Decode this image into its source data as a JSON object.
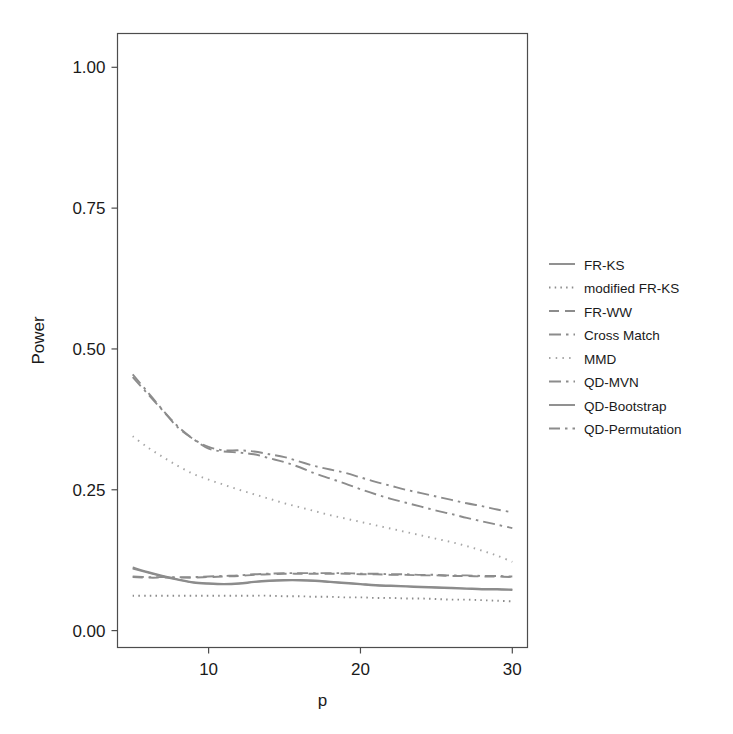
{
  "chart_data": {
    "type": "line",
    "title": "",
    "xlabel": "p",
    "ylabel": "Power",
    "xlim": [
      4,
      31
    ],
    "ylim": [
      -0.03,
      1.06
    ],
    "xticks": [
      10,
      20,
      30
    ],
    "xtick_labels": [
      "10",
      "20",
      "30"
    ],
    "yticks": [
      0.0,
      0.25,
      0.5,
      0.75,
      1.0
    ],
    "ytick_labels": [
      "0.00",
      "0.25",
      "0.50",
      "0.75",
      "1.00"
    ],
    "grid": false,
    "legend_position": "right",
    "palette": {
      "line_gray": "#8c8c8c",
      "line_gray_light": "#a6a6a6",
      "axis": "#4d4d4d",
      "text": "#1a1a1a",
      "background": "#ffffff"
    },
    "x": [
      5,
      6,
      7,
      8,
      9,
      10,
      11,
      12,
      13,
      14,
      15,
      16,
      17,
      18,
      19,
      20,
      21,
      22,
      23,
      24,
      25,
      26,
      27,
      28,
      29,
      30
    ],
    "series": [
      {
        "name": "FR-KS",
        "dash": "solid",
        "color": "#8c8c8c",
        "values": [
          0.11,
          0.103,
          0.096,
          0.09,
          0.085,
          0.083,
          0.082,
          0.083,
          0.086,
          0.088,
          0.089,
          0.089,
          0.088,
          0.086,
          0.084,
          0.082,
          0.08,
          0.079,
          0.078,
          0.077,
          0.076,
          0.075,
          0.074,
          0.073,
          0.073,
          0.072
        ]
      },
      {
        "name": "modified FR-KS",
        "dash": "dotted",
        "color": "#8c8c8c",
        "values": [
          0.062,
          0.062,
          0.062,
          0.062,
          0.062,
          0.062,
          0.062,
          0.062,
          0.062,
          0.062,
          0.061,
          0.061,
          0.06,
          0.06,
          0.059,
          0.059,
          0.058,
          0.058,
          0.057,
          0.057,
          0.056,
          0.055,
          0.055,
          0.054,
          0.053,
          0.052
        ]
      },
      {
        "name": "FR-WW",
        "dash": "dashed",
        "color": "#8c8c8c",
        "values": [
          0.095,
          0.094,
          0.094,
          0.094,
          0.094,
          0.095,
          0.096,
          0.097,
          0.099,
          0.1,
          0.101,
          0.101,
          0.101,
          0.101,
          0.101,
          0.1,
          0.1,
          0.099,
          0.099,
          0.098,
          0.098,
          0.097,
          0.097,
          0.096,
          0.096,
          0.095
        ]
      },
      {
        "name": "Cross Match",
        "dash": "dashdot",
        "color": "#8c8c8c",
        "values": [
          0.45,
          0.42,
          0.39,
          0.36,
          0.34,
          0.326,
          0.32,
          0.32,
          0.318,
          0.313,
          0.308,
          0.3,
          0.292,
          0.286,
          0.28,
          0.272,
          0.264,
          0.257,
          0.25,
          0.244,
          0.238,
          0.232,
          0.226,
          0.221,
          0.215,
          0.21
        ]
      },
      {
        "name": "MMD",
        "dash": "dotted2",
        "color": "#a6a6a6",
        "values": [
          0.345,
          0.325,
          0.308,
          0.292,
          0.278,
          0.268,
          0.259,
          0.25,
          0.242,
          0.234,
          0.226,
          0.219,
          0.212,
          0.205,
          0.199,
          0.193,
          0.187,
          0.181,
          0.175,
          0.169,
          0.163,
          0.157,
          0.15,
          0.142,
          0.133,
          0.122
        ]
      },
      {
        "name": "QD-MVN",
        "dash": "dashdot",
        "color": "#8c8c8c",
        "values": [
          0.455,
          0.423,
          0.391,
          0.362,
          0.34,
          0.323,
          0.318,
          0.316,
          0.313,
          0.306,
          0.299,
          0.29,
          0.279,
          0.27,
          0.261,
          0.251,
          0.242,
          0.234,
          0.227,
          0.22,
          0.213,
          0.207,
          0.2,
          0.194,
          0.188,
          0.182
        ]
      },
      {
        "name": "QD-Bootstrap",
        "dash": "solid",
        "color": "#8c8c8c",
        "values": [
          0.112,
          0.104,
          0.097,
          0.091,
          0.086,
          0.084,
          0.083,
          0.084,
          0.087,
          0.089,
          0.09,
          0.09,
          0.089,
          0.087,
          0.085,
          0.083,
          0.081,
          0.08,
          0.079,
          0.078,
          0.077,
          0.076,
          0.075,
          0.074,
          0.074,
          0.073
        ]
      },
      {
        "name": "QD-Permutation",
        "dash": "dashdot2",
        "color": "#8c8c8c",
        "values": [
          0.096,
          0.095,
          0.095,
          0.095,
          0.095,
          0.096,
          0.097,
          0.098,
          0.1,
          0.101,
          0.102,
          0.102,
          0.102,
          0.102,
          0.102,
          0.101,
          0.101,
          0.1,
          0.1,
          0.099,
          0.099,
          0.098,
          0.098,
          0.097,
          0.097,
          0.096
        ]
      }
    ]
  },
  "legend": {
    "items": [
      {
        "label": "FR-KS",
        "dash": "solid"
      },
      {
        "label": "modified FR-KS",
        "dash": "dotted"
      },
      {
        "label": "FR-WW",
        "dash": "dashed"
      },
      {
        "label": "Cross Match",
        "dash": "dashdot"
      },
      {
        "label": "MMD",
        "dash": "dotted2"
      },
      {
        "label": "QD-MVN",
        "dash": "dashdot"
      },
      {
        "label": "QD-Bootstrap",
        "dash": "solid"
      },
      {
        "label": "QD-Permutation",
        "dash": "dashdot2"
      }
    ]
  }
}
